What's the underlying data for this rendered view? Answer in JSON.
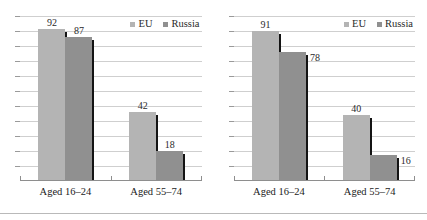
{
  "footer_rule": true,
  "legend": {
    "items": [
      {
        "label": "EU",
        "color": "#b4b4b4",
        "swatch": "square-icon"
      },
      {
        "label": "Russia",
        "color": "#909090",
        "swatch": "square-icon"
      }
    ]
  },
  "axis": {
    "gridline_count": 11,
    "ymin": 0,
    "ymax": 100
  },
  "chart_data": [
    {
      "type": "bar",
      "title": "",
      "subtitle": "",
      "xlabel": "",
      "ylabel": "",
      "categories": [
        "Aged 16–24",
        "Aged 55–74"
      ],
      "series": [
        {
          "name": "EU",
          "color": "#b4b4b4",
          "values": [
            92,
            42
          ]
        },
        {
          "name": "Russia",
          "color": "#909090",
          "values": [
            87,
            18
          ]
        }
      ],
      "ylim": [
        0,
        100
      ],
      "grid": true,
      "legend_position": "top-right",
      "data_labels": true
    },
    {
      "type": "bar",
      "title": "",
      "subtitle": "",
      "xlabel": "",
      "ylabel": "",
      "categories": [
        "Aged 16–24",
        "Aged 55–74"
      ],
      "series": [
        {
          "name": "EU",
          "color": "#b4b4b4",
          "values": [
            91,
            40
          ]
        },
        {
          "name": "Russia",
          "color": "#909090",
          "values": [
            78,
            16
          ]
        }
      ],
      "ylim": [
        0,
        100
      ],
      "grid": true,
      "legend_position": "top-right",
      "data_labels": true
    }
  ]
}
